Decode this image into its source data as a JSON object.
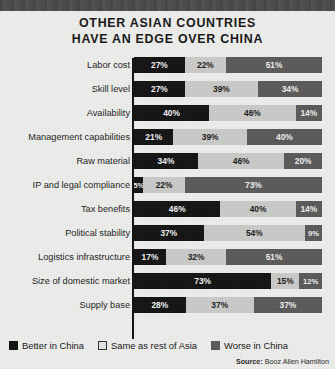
{
  "title": {
    "line1": "OTHER ASIAN COUNTRIES",
    "line2": "HAVE AN EDGE OVER CHINA"
  },
  "source": {
    "label": "Source:",
    "value": "Booz Allen Hamilton"
  },
  "legend": [
    {
      "label": "Better in China",
      "color": "#141414",
      "key": "better-in-china"
    },
    {
      "label": "Same as rest of Asia",
      "color": "#c9c9c7",
      "key": "same-as-rest-of-asia"
    },
    {
      "label": "Worse in China",
      "color": "#5a5a5a",
      "key": "worse-in-china"
    }
  ],
  "chart_data": {
    "type": "bar",
    "orientation": "horizontal",
    "stacked": true,
    "normalized": true,
    "title": "OTHER ASIAN COUNTRIES HAVE AN EDGE OVER CHINA",
    "xlabel": "",
    "ylabel": "",
    "xlim": [
      0,
      100
    ],
    "grid": false,
    "legend_position": "bottom-left",
    "source": "Booz Allen Hamilton",
    "categories": [
      "Labor cost",
      "Skill level",
      "Availability",
      "Management capabilities",
      "Raw material",
      "IP and legal compliance",
      "Tax benefits",
      "Political stability",
      "Logistics infrastructure",
      "Size of domestic market",
      "Supply base"
    ],
    "series": [
      {
        "name": "Better in China",
        "color": "#141414",
        "values": [
          27,
          27,
          40,
          21,
          34,
          5,
          46,
          37,
          17,
          73,
          28
        ]
      },
      {
        "name": "Same as rest of Asia",
        "color": "#c9c9c7",
        "values": [
          22,
          39,
          46,
          39,
          46,
          22,
          40,
          54,
          32,
          15,
          37
        ]
      },
      {
        "name": "Worse in China",
        "color": "#5a5a5a",
        "values": [
          51,
          34,
          14,
          40,
          20,
          73,
          14,
          9,
          51,
          12,
          37
        ]
      }
    ],
    "value_labels": [
      [
        "27%",
        "22%",
        "51%"
      ],
      [
        "27%",
        "39%",
        "34%"
      ],
      [
        "40%",
        "46%",
        "14%"
      ],
      [
        "21%",
        "39%",
        "40%"
      ],
      [
        "34%",
        "46%",
        "20%"
      ],
      [
        "5%",
        "22%",
        "73%"
      ],
      [
        "46%",
        "40%",
        "14%"
      ],
      [
        "37%",
        "54%",
        "9%"
      ],
      [
        "17%",
        "32%",
        "51%"
      ],
      [
        "73%",
        "15%",
        "12%"
      ],
      [
        "28%",
        "37%",
        "37%"
      ]
    ]
  }
}
